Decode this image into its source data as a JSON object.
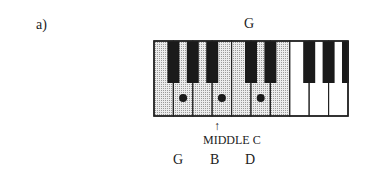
{
  "figure": {
    "label": "a)",
    "top_note": "G",
    "arrow": "↑",
    "middle_c_label": "MIDDLE C",
    "bottom_notes": [
      "G",
      "B",
      "D"
    ]
  },
  "keyboard": {
    "white_key_count": 10,
    "shaded_white_keys": 7,
    "black_key_positions": [
      1,
      2,
      3,
      5,
      6,
      8,
      9,
      10
    ],
    "dotted_white_keys": [
      1,
      3,
      5
    ],
    "colors": {
      "shade": "#d9d9d9",
      "black_key": "#1a1a1a",
      "outline": "#222222",
      "white_key": "#ffffff"
    }
  }
}
